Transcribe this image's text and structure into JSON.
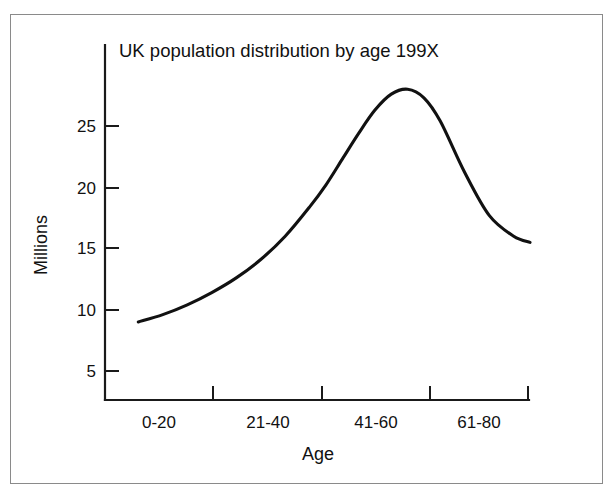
{
  "figure": {
    "background_color": "#ffffff",
    "border_color": "#8a8a8a",
    "line_color": "#111111"
  },
  "chart_data": {
    "type": "line",
    "title": "UK population distribution by age 199X",
    "xlabel": "Age",
    "ylabel": "Millions",
    "grid": false,
    "legend": "none",
    "categories": [
      "0-20",
      "21-40",
      "41-60",
      "61-80"
    ],
    "xtick_labels": [
      "0-20",
      "21-40",
      "41-60",
      "61-80"
    ],
    "ytick_labels": [
      "5",
      "10",
      "15",
      "20",
      "25"
    ],
    "ytick_values": [
      5,
      10,
      15,
      20,
      25
    ],
    "ylim": [
      3,
      30
    ],
    "xlim": [
      0,
      100
    ],
    "series": [
      {
        "name": "UK population",
        "x": [
          4,
          10,
          16,
          22,
          28,
          34,
          40,
          46,
          50,
          54,
          58,
          62,
          66,
          70,
          74,
          78,
          84,
          90,
          96,
          100
        ],
        "values": [
          9.0,
          9.6,
          10.4,
          11.4,
          12.6,
          14.1,
          16.0,
          18.4,
          20.2,
          22.3,
          24.4,
          26.3,
          27.6,
          28.0,
          27.3,
          25.4,
          21.2,
          17.7,
          16.0,
          15.5
        ]
      }
    ],
    "annotations": {
      "peak_value": 28.0,
      "start_value": 9.0,
      "end_value": 15.5
    }
  }
}
